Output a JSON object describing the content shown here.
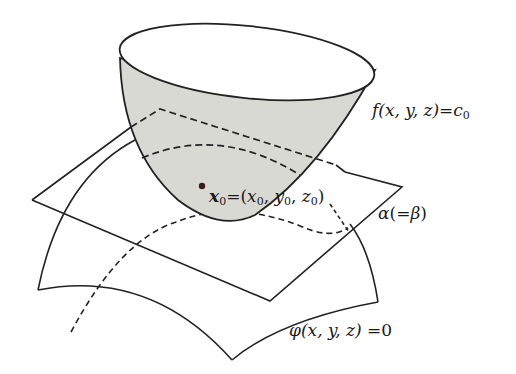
{
  "diagram": {
    "type": "3d-surfaces-tangent-plane",
    "colors": {
      "stroke": "#222222",
      "bowl_fill": "#d9d9d4",
      "background": "#ffffff",
      "point": "#3a1a1a"
    },
    "labels": {
      "level_surface": {
        "func": "f",
        "args": "(x, y, z)",
        "eq": "=",
        "rhs": "c",
        "rhs_sub": "0"
      },
      "point": {
        "name": "x",
        "name_sub": "0",
        "eq": "=",
        "open": "(",
        "x": "x",
        "x_sub": "0",
        "sep1": ", ",
        "y": "y",
        "y_sub": "0",
        "sep2": ", ",
        "z": "z",
        "z_sub": "0",
        "close": ")"
      },
      "plane": {
        "alpha": "α",
        "open": "(",
        "eq": "=",
        "beta": "β",
        "close": ")"
      },
      "constraint_surface": {
        "func": "φ",
        "args": "(x, y, z)",
        "eq": " =",
        "rhs": "0"
      }
    },
    "elements": [
      "bowl surface f(x,y,z)=c0",
      "tangent plane alpha (=beta)",
      "curved surface phi(x,y,z)=0",
      "point x0=(x0,y0,z0)",
      "dashed intersection curves"
    ]
  }
}
